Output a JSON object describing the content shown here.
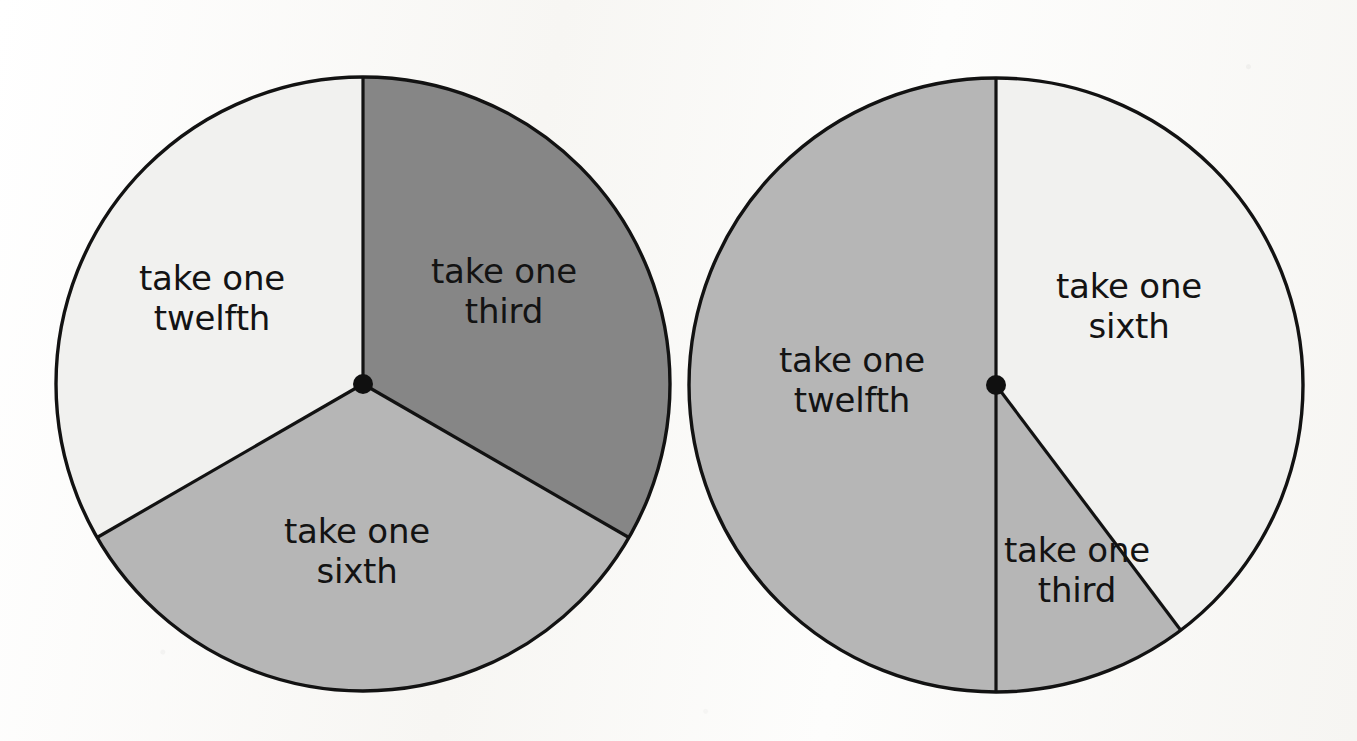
{
  "page": {
    "background_color": "#fbfbf9",
    "width": 1357,
    "height": 741,
    "figure_type": "two fraction spinners"
  },
  "palette": {
    "outline": "#121212",
    "hub": "#101010",
    "light_gray": "#f1f1ef",
    "medium_gray": "#b6b6b6",
    "dark_gray": "#868686",
    "text": "#131313"
  },
  "chart_data": [
    {
      "type": "pie",
      "name": "left-spinner",
      "title": "",
      "center": [
        363,
        384
      ],
      "radius": 307,
      "start_angle_deg": 0,
      "direction": "clockwise",
      "total_degrees": 360,
      "legend": "none",
      "grid": false,
      "categories": [
        "take one third",
        "take one sixth",
        "take one twelfth"
      ],
      "values": [
        120,
        120,
        120
      ],
      "fractions": [
        "1/3",
        "1/3",
        "1/3"
      ],
      "labels": [
        {
          "text": "take one\nthird",
          "line1": "take one",
          "line2": "third",
          "angle_span_deg": [
            0,
            120
          ],
          "share_deg": 120,
          "share_fraction": "1/3",
          "fill": "#868686",
          "x": 504,
          "y": 291
        },
        {
          "text": "take one\nsixth",
          "line1": "take one",
          "line2": "sixth",
          "angle_span_deg": [
            120,
            240
          ],
          "share_deg": 120,
          "share_fraction": "1/3",
          "fill": "#b6b6b6",
          "x": 357,
          "y": 551
        },
        {
          "text": "take one\ntwelfth",
          "line1": "take one",
          "line2": "twelfth",
          "angle_span_deg": [
            240,
            360
          ],
          "share_deg": 120,
          "share_fraction": "1/3",
          "fill": "#f1f1ef",
          "x": 212,
          "y": 298
        }
      ]
    },
    {
      "type": "pie",
      "name": "right-spinner",
      "title": "",
      "center": [
        996,
        385
      ],
      "radius": 307,
      "start_angle_deg": 0,
      "direction": "clockwise",
      "total_degrees": 360,
      "legend": "none",
      "grid": false,
      "categories": [
        "take one sixth",
        "take one third",
        "take one twelfth"
      ],
      "values": [
        143,
        37,
        180
      ],
      "fractions": [
        "143/360",
        "37/360",
        "1/2"
      ],
      "labels": [
        {
          "text": "take one\nsixth",
          "line1": "take one",
          "line2": "sixth",
          "angle_span_deg": [
            0,
            143
          ],
          "share_deg": 143,
          "share_fraction": "143/360",
          "fill": "#f1f1ef",
          "x": 1129,
          "y": 306
        },
        {
          "text": "take one\nthird",
          "line1": "take one",
          "line2": "third",
          "angle_span_deg": [
            143,
            180
          ],
          "share_deg": 37,
          "share_fraction": "37/360",
          "fill": "#b6b6b6",
          "x": 1077,
          "y": 570
        },
        {
          "text": "take one\ntwelfth",
          "line1": "take one",
          "line2": "twelfth",
          "angle_span_deg": [
            180,
            360
          ],
          "share_deg": 180,
          "share_fraction": "1/2",
          "fill": "#b6b6b6",
          "x": 852,
          "y": 380
        }
      ]
    }
  ]
}
